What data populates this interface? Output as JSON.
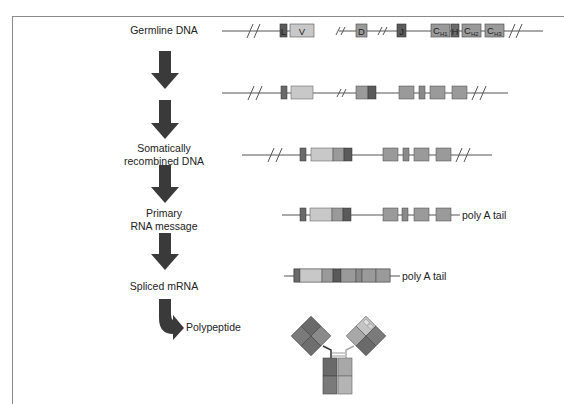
{
  "diagram": {
    "stages": [
      {
        "label": "Germline DNA"
      },
      {
        "label": ""
      },
      {
        "label": "Somatically\nrecombined DNA",
        "line1": "Somatically",
        "line2": "recombined DNA"
      },
      {
        "label": "Primary\nRNA message",
        "line1": "Primary",
        "line2": "RNA message"
      },
      {
        "label": "Spliced mRNA"
      },
      {
        "label": "Polypeptide"
      }
    ],
    "germline_segments": {
      "L": "L",
      "V": "V",
      "D": "D",
      "J": "J",
      "C_main": "C",
      "CH1_sub": "H1",
      "H": "H",
      "CH2_sub": "H2",
      "CH3_sub": "H3"
    },
    "annotations": {
      "poly_a_primary": "poly A tail",
      "poly_a_spliced": "poly A tail"
    },
    "colors": {
      "arrow": "#3a3a3a",
      "line": "#555555",
      "dark_segment": "#5a5a5a",
      "medium_segment": "#8e8e8e",
      "light_segment": "#c4c4c4",
      "frame": "#8a8a8a"
    }
  }
}
